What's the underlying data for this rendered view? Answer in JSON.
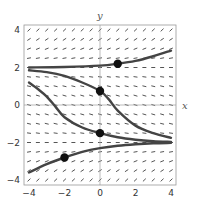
{
  "axes": {
    "x_label": "x",
    "y_label": "y",
    "xlim": [
      -4,
      4
    ],
    "ylim": [
      -4,
      4
    ],
    "x_ticks": [
      {
        "v": -4,
        "label": "−4"
      },
      {
        "v": -2,
        "label": "−2"
      },
      {
        "v": 0,
        "label": "0"
      },
      {
        "v": 2,
        "label": "2"
      },
      {
        "v": 4,
        "label": "4"
      }
    ],
    "y_ticks": [
      {
        "v": 4,
        "label": "4"
      },
      {
        "v": 2,
        "label": "2"
      },
      {
        "v": 0,
        "label": "0"
      },
      {
        "v": -2,
        "label": "−2"
      },
      {
        "v": -4,
        "label": "−4"
      }
    ]
  },
  "slope_field": {
    "spacing": 0.5,
    "description": "small near-horizontal slope marks at every half-unit grid point",
    "color": "#555555"
  },
  "colors": {
    "curve": "#444444",
    "point": "#111111",
    "frame": "#999999",
    "axis": "#aaaaaa"
  },
  "solution_curves": [
    {
      "name": "curve-top",
      "points": [
        [
          -4,
          2.0
        ],
        [
          -2,
          2.03
        ],
        [
          0,
          2.1
        ],
        [
          1,
          2.2
        ],
        [
          2,
          2.35
        ],
        [
          3,
          2.6
        ],
        [
          4,
          2.9
        ]
      ]
    },
    {
      "name": "curve-second",
      "points": [
        [
          -4,
          1.85
        ],
        [
          -3,
          1.75
        ],
        [
          -2,
          1.55
        ],
        [
          -1,
          1.2
        ],
        [
          0,
          0.75
        ],
        [
          0.5,
          0.3
        ],
        [
          1,
          -0.3
        ],
        [
          2,
          -1.1
        ],
        [
          3,
          -1.5
        ],
        [
          4,
          -1.75
        ]
      ]
    },
    {
      "name": "curve-third",
      "points": [
        [
          -4,
          1.2
        ],
        [
          -3.5,
          0.85
        ],
        [
          -3,
          0.45
        ],
        [
          -2.5,
          -0.1
        ],
        [
          -2,
          -0.65
        ],
        [
          -1,
          -1.2
        ],
        [
          0,
          -1.5
        ],
        [
          1,
          -1.72
        ],
        [
          2,
          -1.85
        ],
        [
          3,
          -1.93
        ],
        [
          4,
          -1.97
        ]
      ]
    },
    {
      "name": "curve-bottom",
      "points": [
        [
          -4,
          -3.6
        ],
        [
          -3,
          -3.15
        ],
        [
          -2,
          -2.8
        ],
        [
          -1,
          -2.5
        ],
        [
          0,
          -2.3
        ],
        [
          1,
          -2.17
        ],
        [
          2,
          -2.09
        ],
        [
          3,
          -2.04
        ],
        [
          4,
          -2.02
        ]
      ]
    }
  ],
  "initial_points": [
    {
      "x": 1,
      "y": 2.2
    },
    {
      "x": 0,
      "y": 0.75
    },
    {
      "x": 0,
      "y": -1.5
    },
    {
      "x": -2,
      "y": -2.8
    }
  ]
}
